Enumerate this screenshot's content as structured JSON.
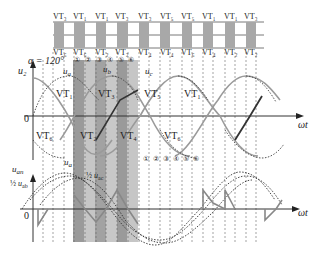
{
  "diagram": {
    "alpha_label": "α = 120°",
    "top_strip": {
      "upper_labels": [
        "VT1",
        "VT1",
        "VT1",
        "VT3",
        "VT3",
        "VT5",
        "VT5",
        "VT1",
        "VT1",
        "VT3"
      ],
      "upper_display": [
        "VT₃",
        "VT₁",
        "VT₁",
        "VT₃",
        "VT₃",
        "VT₅",
        "VT₅",
        "VT₁",
        "VT₁",
        "VT₃"
      ],
      "lower_display": [
        "VT₆",
        "VT₆",
        "VT₂",
        "VT₂",
        "VT₄",
        "VT₄",
        "VT₆",
        "VT₄",
        "VT₂",
        "VT₂"
      ]
    },
    "upper_plot": {
      "y_label": "u₂",
      "zero_label": "0",
      "x_label": "ωt",
      "phase_labels": [
        "uₐ",
        "u_b",
        "u_c"
      ],
      "phase_display": [
        "u",
        "u",
        "u"
      ],
      "phase_sub": [
        "a",
        "b",
        "c"
      ],
      "positive_conduction": [
        "VT₁",
        "VT₃",
        "VT₅",
        "VT₁"
      ],
      "negative_conduction": [
        "VT₆",
        "VT₂",
        "VT₄",
        "VT₆"
      ],
      "interval_markers": [
        "①",
        "②",
        "③",
        "④",
        "⑤",
        "⑥"
      ]
    },
    "lower_plot": {
      "y_label_top": "u",
      "y_label_sub": "an",
      "annotation_half_uab": "½ u_ab",
      "annotation_half_uac": "½ u_ac",
      "phase_label": "u_a",
      "zero_label": "0",
      "x_label": "ωt",
      "interval_markers": [
        "①",
        "②",
        "③",
        "④",
        "⑤",
        "⑥"
      ]
    },
    "colors": {
      "strip_fill": "#a8a8a8",
      "band_dark": "#9c9c9c",
      "band_light": "#c8c8c8",
      "curve_gray": "#8a8a8a",
      "curve_dark": "#333333",
      "dashed": "#555555"
    }
  }
}
